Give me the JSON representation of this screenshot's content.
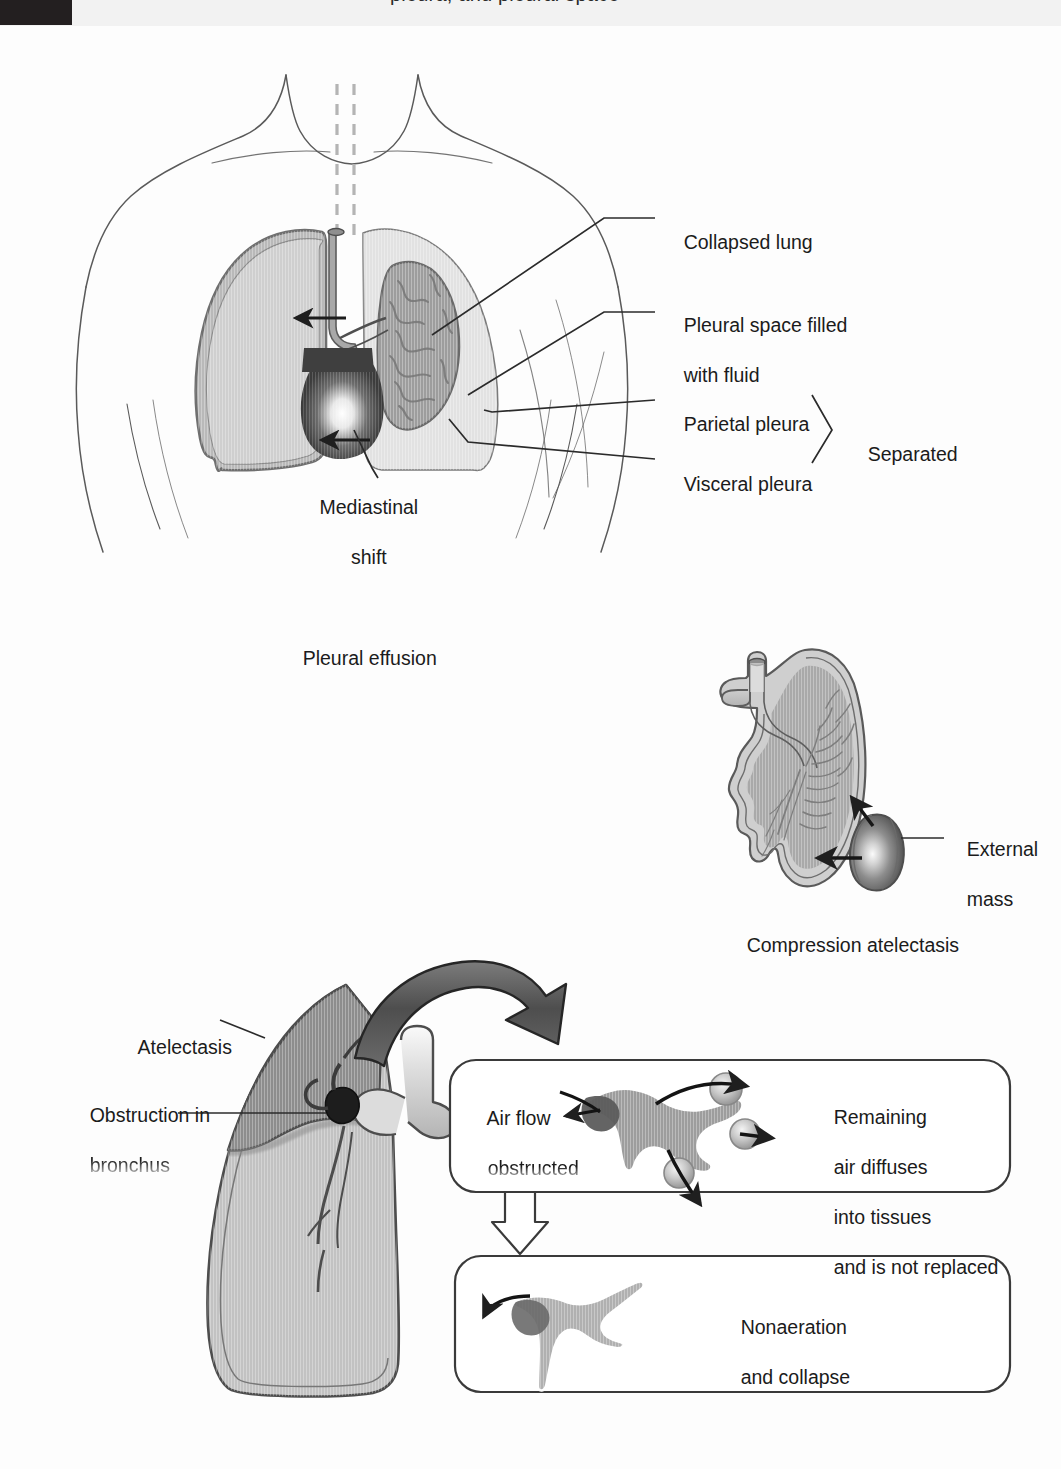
{
  "header": {
    "clipped_text": "pleura, and pleural space",
    "block_color": "#231f20"
  },
  "palette": {
    "ink": "#1b1b1b",
    "outline": "#3a3a3a",
    "body_outline": "#555555",
    "lung_normal": "#c9c9c9",
    "lung_normal_rim": "#8e8e8e",
    "pleural_space": "#dedede",
    "collapsed_lung": "#9a9a9a",
    "collapsed_lung_rim": "#6f6f6f",
    "mediastinum": "#4a4a4a",
    "atelectatic_lobe": "#8b8b8b",
    "lower_lung": "#c4c4c4",
    "bronchus": "#d8d8d8",
    "mass": "#8a8a8a",
    "arrow_dark": "#2a2a2a",
    "paper": "#fdfdfd"
  },
  "panels": [
    {
      "id": "pleural-effusion",
      "caption": "Pleural effusion",
      "labels": [
        {
          "id": "collapsed-lung",
          "text": "Collapsed lung"
        },
        {
          "id": "pleural-space-fluid",
          "text_line1": "Pleural space filled",
          "text_line2": "with fluid"
        },
        {
          "id": "parietal-pleura",
          "text": "Parietal pleura"
        },
        {
          "id": "visceral-pleura",
          "text": "Visceral pleura"
        },
        {
          "id": "separated",
          "text": "Separated"
        },
        {
          "id": "mediastinal-shift",
          "text_line1": "Mediastinal",
          "text_line2": "shift"
        }
      ]
    },
    {
      "id": "compression-atelectasis",
      "caption": "Compression atelectasis",
      "labels": [
        {
          "id": "external-mass",
          "text_line1": "External",
          "text_line2": "mass"
        }
      ]
    },
    {
      "id": "obstructive-atelectasis",
      "caption": "",
      "labels": [
        {
          "id": "atelectasis",
          "text": "Atelectasis"
        },
        {
          "id": "obstruction",
          "text_line1": "Obstruction in",
          "text_line2": "bronchus"
        }
      ],
      "callouts": [
        {
          "id": "air-flow-obstructed",
          "left_text_line1": "Air flow",
          "left_text_line2": "obstructed",
          "right_text_line1": "Remaining",
          "right_text_line2": "air diffuses",
          "right_text_line3": "into tissues",
          "right_text_line4": "and is not replaced"
        },
        {
          "id": "nonaeration-collapse",
          "text_line1": "Nonaeration",
          "text_line2": "and collapse"
        }
      ]
    }
  ]
}
